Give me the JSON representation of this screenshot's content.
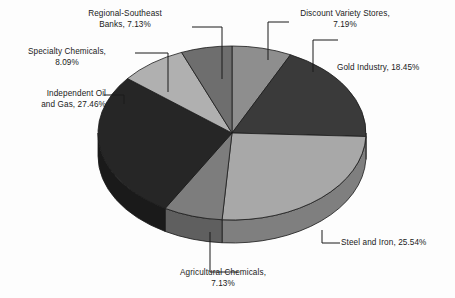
{
  "chart_data": {
    "type": "pie",
    "title": "",
    "subtitle": "",
    "xlabel": "",
    "ylabel": "",
    "legend_position": "none",
    "grid": false,
    "three_d": true,
    "label_format": "{name}, {value}%",
    "categories": [
      "Discount Variety Stores",
      "Gold Industry",
      "Steel and Iron",
      "Agricultural Chemicals",
      "Independent Oil and Gas",
      "Specialty Chemicals",
      "Regional-Southeast Banks"
    ],
    "values": [
      7.19,
      18.45,
      25.54,
      7.13,
      27.46,
      8.09,
      7.13
    ],
    "slices": [
      {
        "name": "Discount Variety Stores",
        "value": 7.19,
        "label": "Discount Variety Stores,\n7.19%",
        "color": "#8e8e8e",
        "side_color": "#6d6d6d",
        "start_angle": 0,
        "end_angle": 25.884
      },
      {
        "name": "Gold Industry",
        "value": 18.45,
        "label": "Gold Industry, 18.45%",
        "color": "#3a3a3a",
        "side_color": "#2a2a2a",
        "start_angle": 25.884,
        "end_angle": 92.304
      },
      {
        "name": "Steel and Iron",
        "value": 25.54,
        "label": "Steel and Iron, 25.54%",
        "color": "#a8a8a8",
        "side_color": "#7f7f7f",
        "start_angle": 92.304,
        "end_angle": 184.248
      },
      {
        "name": "Agricultural Chemicals",
        "value": 7.13,
        "label": "Agricultural Chemicals,\n7.13%",
        "color": "#7d7d7d",
        "side_color": "#5f5f5f",
        "start_angle": 184.248,
        "end_angle": 209.916
      },
      {
        "name": "Independent Oil and Gas",
        "value": 27.46,
        "label": "Independent Oil\nand Gas, 27.46%",
        "color": "#262626",
        "side_color": "#1a1a1a",
        "start_angle": 209.916,
        "end_angle": 308.772
      },
      {
        "name": "Specialty Chemicals",
        "value": 8.09,
        "label": "Specialty Chemicals,\n8.09%",
        "color": "#b0b0b0",
        "side_color": "#8a8a8a",
        "start_angle": 308.772,
        "end_angle": 337.896
      },
      {
        "name": "Regional-Southeast Banks",
        "value": 7.13,
        "label": "Regional-Southeast\nBanks, 7.13%",
        "color": "#6e6e6e",
        "side_color": "#545454",
        "start_angle": 337.896,
        "end_angle": 360
      }
    ],
    "total": 101.39,
    "background_color": "#fdfdfd",
    "outline_color": "#1a1a1a",
    "leader_line_color": "#1a1a1a"
  },
  "labels": {
    "discount": "Discount Variety Stores,\n7.19%",
    "gold": "Gold Industry, 18.45%",
    "steel": "Steel and Iron, 25.54%",
    "agricultural": "Agricultural Chemicals,\n7.13%",
    "oil": "Independent Oil\nand Gas, 27.46%",
    "specialty": "Specialty Chemicals,\n8.09%",
    "regional": "Regional-Southeast\nBanks, 7.13%"
  }
}
